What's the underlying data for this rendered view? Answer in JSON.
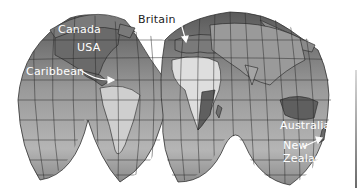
{
  "map": {
    "type": "interrupted world map (grayscale)",
    "colors": {
      "ocean": "#8e8e8e",
      "ocean_light": "#b8b8b8",
      "land_dark": "#5f5f5f",
      "land_light": "#dcdcdc",
      "grid": "#2b2b2b",
      "label": "#ffffff",
      "label_dark": "#222222"
    },
    "labels": [
      {
        "id": "canada",
        "text": "Canada"
      },
      {
        "id": "usa",
        "text": "USA"
      },
      {
        "id": "caribbean",
        "text": "Caribbean"
      },
      {
        "id": "britain",
        "text": "Britain"
      },
      {
        "id": "australia",
        "text": "Australia"
      },
      {
        "id": "new_zealand_line1",
        "text": "New"
      },
      {
        "id": "new_zealand_line2",
        "text": "Zealand"
      }
    ]
  }
}
